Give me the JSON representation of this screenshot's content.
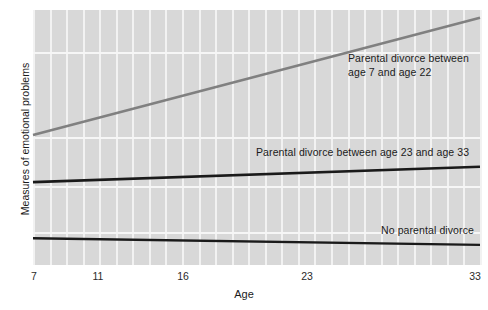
{
  "chart_data": {
    "type": "line",
    "title": "",
    "xlabel": "Age",
    "ylabel": "Measures of emotional problems",
    "xlim": [
      7,
      33
    ],
    "ylim": [
      0,
      1
    ],
    "xticks": [
      7,
      11,
      16,
      23,
      33
    ],
    "xtick_labels": [
      "7",
      "11",
      "16",
      "23",
      "33"
    ],
    "ytick_labels": [],
    "grid": true,
    "legend_position": "inline-annotations",
    "plot_background": "#d8d8d8",
    "gridline_color": "#f4f4f4",
    "series": [
      {
        "name": "Parental divorce between age 7 and age 22",
        "color": "#808080",
        "width": 2.6,
        "x": [
          7,
          33
        ],
        "y": [
          0.51,
          0.97
        ],
        "annotation": "Parental divorce between\nage 7 and age 22"
      },
      {
        "name": "Parental divorce between age 23 and age 33",
        "color": "#1a1a1a",
        "width": 2.6,
        "x": [
          7,
          33
        ],
        "y": [
          0.325,
          0.385
        ],
        "annotation": "Parental divorce between age 23 and age 33"
      },
      {
        "name": "No parental divorce",
        "color": "#1a1a1a",
        "width": 2.4,
        "x": [
          7,
          33
        ],
        "y": [
          0.105,
          0.079
        ],
        "annotation": "No parental divorce"
      }
    ]
  },
  "axes": {
    "x_title": "Age",
    "y_title": "Measures of emotional problems",
    "x_tick_7": "7",
    "x_tick_11": "11",
    "x_tick_16": "16",
    "x_tick_23": "23",
    "x_tick_33": "33"
  },
  "annotations": {
    "divorce_7_22": "Parental divorce between\nage 7 and age 22",
    "divorce_23_33": "Parental divorce between age 23 and age 33",
    "no_divorce": "No parental divorce"
  }
}
